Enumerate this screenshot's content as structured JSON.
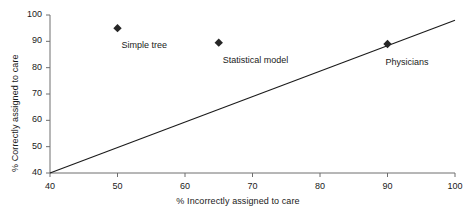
{
  "chart_data": {
    "type": "scatter",
    "title": "",
    "subtitle": "",
    "xlabel": "% Incorrectly assigned to care",
    "ylabel": "% Correctly assigned to care",
    "xlim": [
      40,
      100
    ],
    "ylim": [
      40,
      100
    ],
    "xticks": [
      40,
      50,
      60,
      70,
      80,
      90,
      100
    ],
    "yticks": [
      40,
      50,
      60,
      70,
      80,
      90,
      100
    ],
    "xtick_labels": [
      "40",
      "50",
      "60",
      "70",
      "80",
      "90",
      "100"
    ],
    "ytick_labels": [
      "40",
      "50",
      "60",
      "70",
      "80",
      "90",
      "100"
    ],
    "grid": false,
    "legend": "none",
    "marker": "diamond",
    "marker_color": "#262626",
    "line_color": "#1a1a1a",
    "points": [
      {
        "label": "Simple tree",
        "x": 50,
        "y": 95,
        "label_dx": 4,
        "label_dy": 12
      },
      {
        "label": "Statistical model",
        "x": 65,
        "y": 89.5,
        "label_dx": 4,
        "label_dy": 12
      },
      {
        "label": "Physicians",
        "x": 90,
        "y": 89,
        "label_dx": -2,
        "label_dy": 13
      }
    ],
    "reference_line": {
      "name": "diagonal reference line",
      "x0": 40,
      "y0": 40,
      "x1": 100,
      "y1": 98
    },
    "annotations": [
      "Simple tree",
      "Statistical model",
      "Physicians"
    ]
  },
  "axes": {
    "x_title": "% Incorrectly assigned to care",
    "y_title": "% Correctly assigned to care"
  },
  "colors": {
    "axis": "#6e6e6e",
    "ink": "#1a1a1a",
    "marker": "#262626",
    "background": "#ffffff"
  }
}
